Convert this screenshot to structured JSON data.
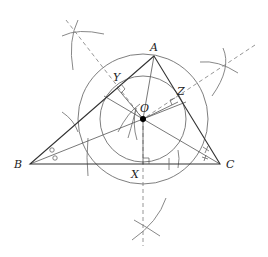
{
  "diagram": {
    "type": "geometric-construction",
    "points": {
      "A": {
        "label": "A",
        "x": 154,
        "y": 56
      },
      "B": {
        "label": "B",
        "x": 30,
        "y": 164
      },
      "C": {
        "label": "C",
        "x": 220,
        "y": 164
      },
      "O": {
        "label": "O",
        "x": 143,
        "y": 119
      },
      "X": {
        "label": "X",
        "x": 143,
        "y": 164
      },
      "Y": {
        "label": "Y",
        "x": 117,
        "y": 88
      },
      "Z": {
        "label": "Z",
        "x": 178,
        "y": 102
      }
    },
    "labels": {
      "A": "A",
      "B": "B",
      "C": "C",
      "O": "O",
      "X": "X",
      "Y": "Y",
      "Z": "Z"
    },
    "circles": [
      {
        "name": "incircle",
        "cx": 143,
        "cy": 119,
        "r": 43
      },
      {
        "name": "outer-circle",
        "cx": 143,
        "cy": 119,
        "r": 65
      }
    ],
    "angle_marks": {
      "B": "o",
      "C": "x"
    },
    "colors": {
      "sides": "#333333",
      "circles": "#6f6f6f",
      "construction": "#8a8a8a",
      "incenter": "#000000"
    }
  }
}
